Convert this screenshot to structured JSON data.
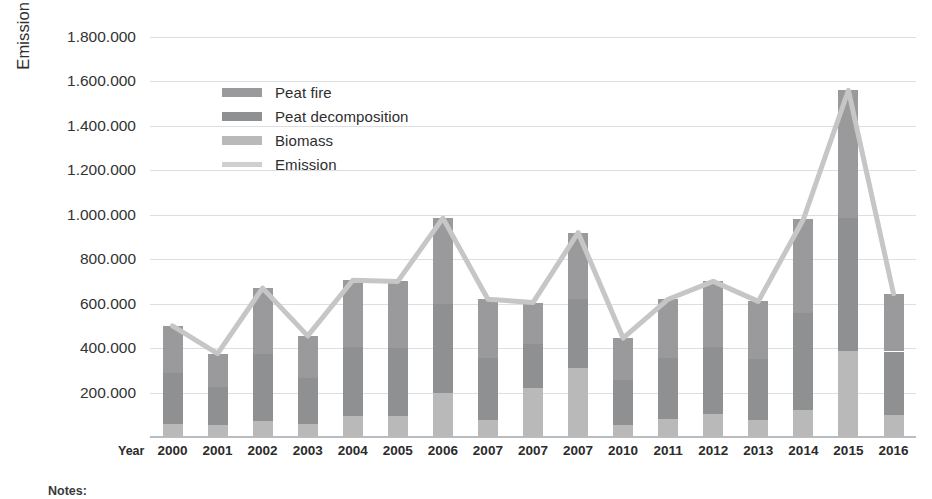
{
  "chart_data": {
    "type": "bar",
    "title": "",
    "subtitle": "",
    "xlabel": "Year",
    "ylabel": "Emission (Gg CO2e)",
    "ylabel_rich": {
      "prefix": "Emission (Gg CO",
      "sub": "2",
      "suffix": "e)"
    },
    "grid": true,
    "legend_position": "inside-top-left",
    "ylim": [
      0,
      1800000
    ],
    "ytick_labels": [
      "1.800.000",
      "1.600.000",
      "1.400.000",
      "1.200.000",
      "1.000.000",
      "800.000",
      "600.000",
      "400.000",
      "200.000"
    ],
    "ytick_values": [
      1800000,
      1600000,
      1400000,
      1200000,
      1000000,
      800000,
      600000,
      400000,
      200000
    ],
    "categories": [
      "2000",
      "2001",
      "2002",
      "2003",
      "2004",
      "2005",
      "2006",
      "2007",
      "2007",
      "2007",
      "2010",
      "2011",
      "2012",
      "2013",
      "2014",
      "2015",
      "2016"
    ],
    "stacked": true,
    "series": [
      {
        "name": "Biomass",
        "color": "#b9b9b9",
        "values": [
          60000,
          55000,
          70000,
          60000,
          95000,
          95000,
          200000,
          75000,
          220000,
          310000,
          55000,
          80000,
          105000,
          75000,
          120000,
          385000,
          100000
        ]
      },
      {
        "name": "Peat decomposition",
        "color": "#8f9092",
        "values": [
          230000,
          170000,
          305000,
          205000,
          310000,
          305000,
          400000,
          280000,
          200000,
          310000,
          200000,
          275000,
          300000,
          275000,
          440000,
          600000,
          285000
        ]
      },
      {
        "name": "Peat fire",
        "color": "#9a9a9c",
        "values": [
          210000,
          150000,
          295000,
          190000,
          300000,
          300000,
          385000,
          265000,
          185000,
          300000,
          190000,
          265000,
          295000,
          260000,
          420000,
          575000,
          260000
        ]
      }
    ],
    "line_series": {
      "name": "Emission",
      "color": "#c6c6c6",
      "values": [
        500000,
        375000,
        670000,
        455000,
        705000,
        700000,
        985000,
        620000,
        605000,
        920000,
        445000,
        620000,
        700000,
        610000,
        980000,
        1560000,
        645000
      ]
    },
    "bar_totals": [
      500000,
      375000,
      670000,
      455000,
      705000,
      700000,
      985000,
      620000,
      605000,
      920000,
      445000,
      620000,
      700000,
      610000,
      980000,
      1560000,
      645000
    ]
  },
  "legend": {
    "items": [
      {
        "label": "Peat fire",
        "color": "#9a9a9c",
        "kind": "swatch"
      },
      {
        "label": "Peat decomposition",
        "color": "#8f9092",
        "kind": "swatch"
      },
      {
        "label": "Biomass",
        "color": "#b9b9b9",
        "kind": "swatch"
      },
      {
        "label": "Emission",
        "color": "#cfcfcf",
        "kind": "line"
      }
    ]
  },
  "axis": {
    "x_axis_name": "Year"
  },
  "footer": {
    "notes_label": "Notes:"
  },
  "colors": {
    "background": "#ffffff",
    "gridline": "#dcdee2",
    "axis": "#b9bcc0",
    "text": "#2f2f2f"
  }
}
